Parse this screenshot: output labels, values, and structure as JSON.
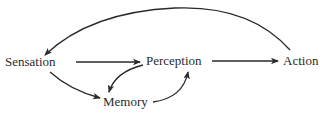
{
  "diagram": {
    "nodes": [
      {
        "id": "sensation",
        "label": "Sensation"
      },
      {
        "id": "perception",
        "label": "Perception"
      },
      {
        "id": "action",
        "label": "Action"
      },
      {
        "id": "memory",
        "label": "Memory"
      }
    ],
    "edges": [
      {
        "from": "sensation",
        "to": "perception"
      },
      {
        "from": "perception",
        "to": "action"
      },
      {
        "from": "sensation",
        "to": "memory"
      },
      {
        "from": "perception",
        "to": "memory"
      },
      {
        "from": "memory",
        "to": "perception"
      },
      {
        "from": "action",
        "to": "sensation"
      }
    ],
    "colors": {
      "ink": "#2a2a2a",
      "background": "#ffffff"
    }
  }
}
